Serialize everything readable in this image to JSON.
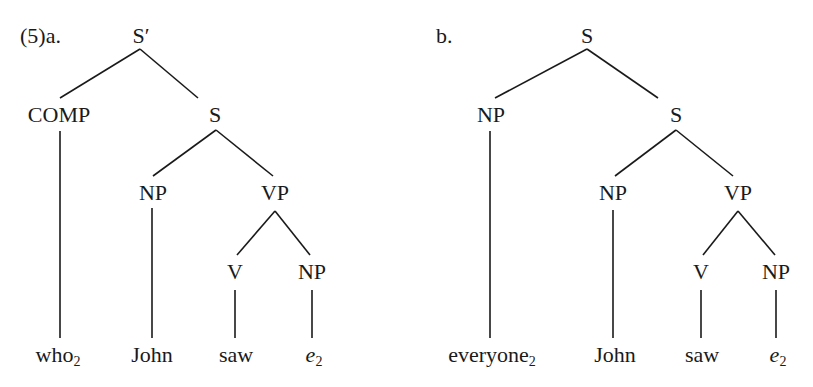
{
  "example_number": "(5)",
  "trees": [
    {
      "id": "a",
      "label": "(5)a.",
      "nodes": {
        "root": "S′",
        "comp": "COMP",
        "s": "S",
        "np_subj": "NP",
        "vp": "VP",
        "v": "V",
        "np_obj": "NP"
      },
      "leaves": {
        "wh": {
          "word": "who",
          "index": "2"
        },
        "subj": {
          "word": "John"
        },
        "verb": {
          "word": "saw"
        },
        "trace": {
          "word": "e",
          "index": "2"
        }
      }
    },
    {
      "id": "b",
      "label": "b.",
      "nodes": {
        "root": "S",
        "np_quant": "NP",
        "s": "S",
        "np_subj": "NP",
        "vp": "VP",
        "v": "V",
        "np_obj": "NP"
      },
      "leaves": {
        "quant": {
          "word": "everyone",
          "index": "2"
        },
        "subj": {
          "word": "John"
        },
        "verb": {
          "word": "saw"
        },
        "trace": {
          "word": "e",
          "index": "2"
        }
      }
    }
  ]
}
